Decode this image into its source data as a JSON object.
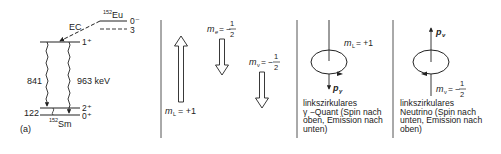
{
  "panel_a": {
    "label": "(a)",
    "parent_nucleus": {
      "mass": "152",
      "symbol": "Eu",
      "level_spin": "0⁻",
      "dashed_level_spin": "3"
    },
    "decay_mode": "EC",
    "intermediate_level": {
      "spin": "1⁺"
    },
    "gamma_1": {
      "energy": "841"
    },
    "gamma_2": {
      "energy": "963 keV"
    },
    "daughter_nucleus": {
      "mass": "152",
      "symbol": "Sm"
    },
    "level_2plus": {
      "spin": "2⁺",
      "energy": "122"
    },
    "level_0plus": {
      "spin": "0⁺"
    }
  },
  "panel_spins": {
    "m_L": {
      "symbol": "m",
      "subscript": "L",
      "value": "= +1",
      "arrow": "up"
    },
    "m_e": {
      "symbol": "m",
      "subscript": "e",
      "value": "= −",
      "numerator": "1",
      "denominator": "2",
      "arrow": "down"
    },
    "m_nu": {
      "symbol": "m",
      "subscript": "ν",
      "value": "= −",
      "numerator": "1",
      "denominator": "2",
      "arrow": "down"
    }
  },
  "panel_gamma": {
    "spin_label": {
      "symbol": "m",
      "subscript": "L",
      "value": "= +1"
    },
    "momentum_label": {
      "symbol": "p",
      "subscript": "γ"
    },
    "caption": [
      "linkszirkulares",
      "γ −Quant (Spin nach",
      "oben, Emission nach",
      "unten)"
    ]
  },
  "panel_neutrino": {
    "spin_label": {
      "symbol": "m",
      "subscript": "ν",
      "value": "= −",
      "numerator": "1",
      "denominator": "2"
    },
    "momentum_label": {
      "symbol": "p",
      "subscript": "ν"
    },
    "caption": [
      "linkszirkulares",
      "Neutrino (Spin nach",
      "unten, Emission nach",
      "oben)"
    ]
  },
  "colors": {
    "ink": "#222222",
    "background": "#ffffff"
  }
}
